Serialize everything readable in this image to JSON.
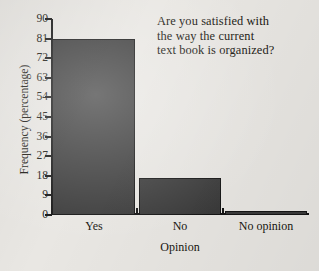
{
  "chart_data": {
    "type": "bar",
    "title": "Are you satisfied with the way the current text book is organized?",
    "title_lines": [
      "Are you satisfied with",
      "the way the current",
      "text book is organized?"
    ],
    "categories": [
      "Yes",
      "No",
      "No opinion"
    ],
    "values": [
      81,
      17,
      2
    ],
    "series": [
      {
        "name": "Frequency (percentage)",
        "values": [
          81,
          17,
          2
        ]
      }
    ],
    "xlabel": "Opinion",
    "ylabel": "Frequency (percentage)",
    "ylim": [
      0,
      90
    ],
    "yticks": [
      0,
      9,
      18,
      27,
      36,
      45,
      54,
      63,
      72,
      81,
      90
    ],
    "ytick_labels": [
      "0",
      "9",
      "18",
      "27",
      "36",
      "45",
      "54",
      "63",
      "72",
      "81",
      "90"
    ],
    "grid": false,
    "legend": false,
    "legend_position": "none",
    "bar_color": "#3b3b3b",
    "axis_color": "#141414",
    "background_color": "#e9e7e3",
    "text_color": "#17150f"
  }
}
